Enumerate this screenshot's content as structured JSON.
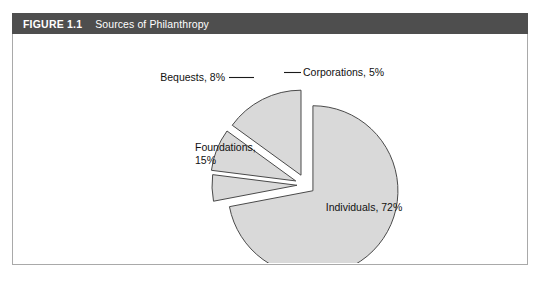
{
  "figure": {
    "number": "FIGURE 1.1",
    "title": "Sources of Philanthropy"
  },
  "colors": {
    "header_background": "#4e4e4e",
    "header_text": "#ffffff",
    "frame_border": "#a9a9a9",
    "slice_fill": "#d9d9d9",
    "slice_stroke": "#4a4a4a",
    "label_text": "#111111",
    "page_background": "#ffffff"
  },
  "chart_data": {
    "type": "pie",
    "title": "Sources of Philanthropy",
    "exploded": true,
    "legend": "none",
    "labels_position": "callout",
    "categories": [
      "Individuals",
      "Corporations",
      "Bequests",
      "Foundations"
    ],
    "values": [
      72,
      5,
      8,
      15
    ],
    "unit": "%",
    "slices": [
      {
        "name": "Individuals",
        "value": 72,
        "label": "Individuals, 72%",
        "label_lines": [
          "Individuals, 72%"
        ],
        "label_x": 351,
        "label_y": 177,
        "label_anchor": "middle",
        "start_angle": 0,
        "end_angle": 259.2,
        "explode_offset": 9,
        "has_leader": false
      },
      {
        "name": "Corporations",
        "value": 5,
        "label": "Corporations, 5%",
        "label_lines": [
          "Corporations, 5%"
        ],
        "label_x": 290,
        "label_y": 42,
        "label_anchor": "start",
        "start_angle": 259.2,
        "end_angle": 277.2,
        "explode_offset": 9,
        "has_leader": true,
        "leader": {
          "x1": 271,
          "y1": 38.5,
          "x2": 288,
          "y2": 38.5
        }
      },
      {
        "name": "Bequests",
        "value": 8,
        "label": "Bequests, 8%",
        "label_lines": [
          "Bequests, 8%"
        ],
        "label_x": 212,
        "label_y": 47,
        "label_anchor": "end",
        "start_angle": 277.2,
        "end_angle": 306.0,
        "explode_offset": 11,
        "has_leader": true,
        "leader": {
          "x1": 216,
          "y1": 43.5,
          "x2": 241,
          "y2": 43.5
        }
      },
      {
        "name": "Foundations",
        "value": 15,
        "label": "Foundations, 15%",
        "label_lines": [
          "Foundations,",
          "15%"
        ],
        "label_x": 182,
        "label_y": 117,
        "label_anchor": "start",
        "start_angle": 306.0,
        "end_angle": 360.0,
        "explode_offset": 11,
        "has_leader": false
      }
    ],
    "geometry": {
      "center_x": 293,
      "center_y": 151,
      "radius": 85
    }
  }
}
